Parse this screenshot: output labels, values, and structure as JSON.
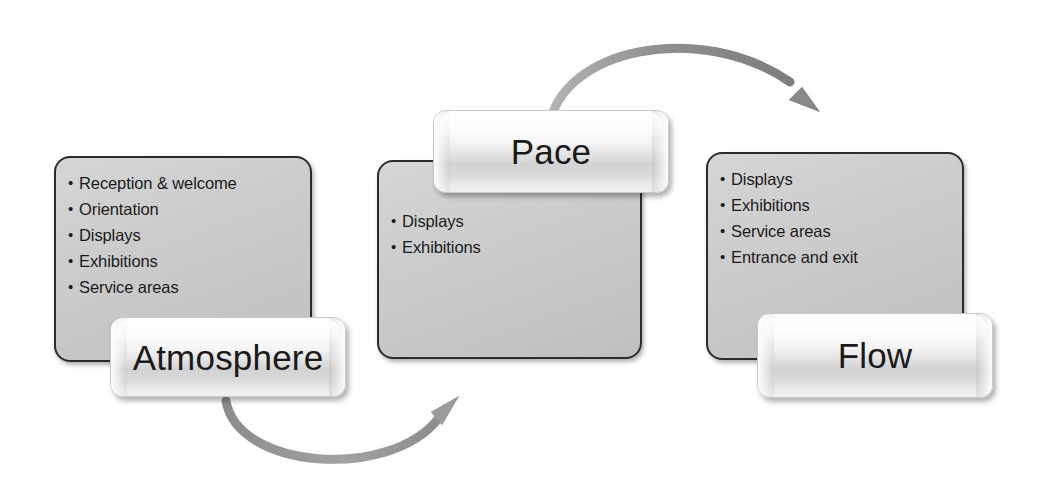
{
  "diagram": {
    "type": "cycle-diagram",
    "background_color": "#ffffff",
    "panel_fill": "#cccccc",
    "panel_border": "#2b2b2b",
    "label_fill": "#f0f0f0",
    "arrow_color": "#8a8a8a",
    "text_color": "#1a1a1a"
  },
  "stages": [
    {
      "id": "atmosphere",
      "label": "Atmosphere",
      "items": [
        "Reception & welcome",
        "Orientation",
        "Displays",
        "Exhibitions",
        "Service areas"
      ]
    },
    {
      "id": "pace",
      "label": "Pace",
      "items": [
        "Displays",
        "Exhibitions"
      ]
    },
    {
      "id": "flow",
      "label": "Flow",
      "items": [
        "Displays",
        "Exhibitions",
        "Service areas",
        "Entrance and exit"
      ]
    }
  ],
  "connectors": [
    {
      "id": "atmosphere-to-pace",
      "icon": "curved-arrow-up-right-icon",
      "from": "atmosphere",
      "to": "pace",
      "direction": "up-right"
    },
    {
      "id": "pace-to-flow",
      "icon": "curved-arrow-down-right-icon",
      "from": "pace",
      "to": "flow",
      "direction": "down-right"
    }
  ]
}
